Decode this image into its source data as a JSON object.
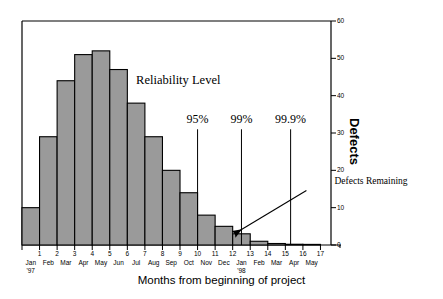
{
  "chart_data": {
    "type": "bar",
    "title": "",
    "xlabel": "Months from beginning of project",
    "ylabel": "Defects",
    "ylim": [
      0,
      60
    ],
    "xlim": [
      0,
      17.6
    ],
    "grid": false,
    "legend": null,
    "yticks": [
      0,
      10,
      20,
      30,
      40,
      50,
      60
    ],
    "ytick_labels": [
      "0",
      "10",
      "20",
      "30",
      "40",
      "50",
      "60"
    ],
    "y_axis_position": "right",
    "xticks": [
      1,
      2,
      3,
      4,
      5,
      6,
      7,
      8,
      9,
      10,
      11,
      12,
      13,
      14,
      15,
      16,
      17
    ],
    "xtick_labels": [
      "1",
      "2",
      "3",
      "4",
      "5",
      "6",
      "7",
      "8",
      "9",
      "10",
      "11",
      "12",
      "13",
      "14",
      "15",
      "16",
      "17"
    ],
    "month_labels": [
      "Jan",
      "Feb",
      "Mar",
      "Apr",
      "May",
      "Jun",
      "Jul",
      "Aug",
      "Sep",
      "Oct",
      "Nov",
      "Dec",
      "Jan",
      "Feb",
      "Mar",
      "Apr",
      "May"
    ],
    "year_labels": [
      {
        "index": 0,
        "text": "'97"
      },
      {
        "index": 12,
        "text": "'98"
      }
    ],
    "bar_color": "#9a9a9a",
    "bar_edge_color": "#000000",
    "categories": [
      "Jan '97",
      "Feb",
      "Mar",
      "Apr",
      "May",
      "Jun",
      "Jul",
      "Aug",
      "Sep",
      "Oct",
      "Nov",
      "Dec",
      "Jan '98",
      "Feb",
      "Mar",
      "Apr",
      "May"
    ],
    "values": [
      10,
      29,
      44,
      51,
      52,
      47,
      38,
      29,
      20,
      14,
      8,
      5,
      3,
      1,
      0.4,
      0.2,
      0.1
    ],
    "annotations": [
      {
        "name": "reliability-heading",
        "text": "Reliability Level",
        "x_month": 8.9,
        "y_value": 44
      },
      {
        "name": "defects-remaining",
        "text": "Defects Remaining",
        "x_month": 17.8,
        "y_value": 16.5
      }
    ],
    "reference_lines": [
      {
        "label": "95%",
        "x_month": 10.0,
        "y_top": 31.0
      },
      {
        "label": "99%",
        "x_month": 12.5,
        "y_top": 31.0
      },
      {
        "label": "99.9%",
        "x_month": 15.3,
        "y_top": 31.0
      }
    ],
    "arrow": {
      "name": "defects-remaining-arrow",
      "from_x_month": 16.2,
      "from_y_value": 14.6,
      "to_x_month": 12.1,
      "to_y_value": 3.0
    }
  }
}
